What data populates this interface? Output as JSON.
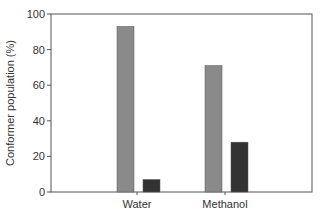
{
  "chart_data": {
    "type": "bar",
    "title": "",
    "xlabel": "",
    "ylabel": "Conformer population (%)",
    "ylim": [
      0,
      100
    ],
    "yticks": [
      0,
      20,
      40,
      60,
      80,
      100
    ],
    "categories": [
      "Water",
      "Methanol"
    ],
    "series": [
      {
        "name": "Conformer A",
        "color": "#8a8a8a",
        "values": [
          93,
          71
        ]
      },
      {
        "name": "Conformer B",
        "color": "#333333",
        "values": [
          7,
          28
        ]
      }
    ],
    "grid": false,
    "legend": "none"
  }
}
